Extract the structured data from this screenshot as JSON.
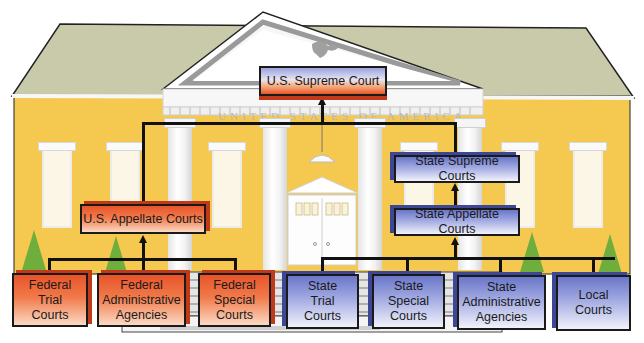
{
  "diagram": {
    "type": "hierarchy",
    "theme": "United States court system illustrated as a courthouse",
    "building": {
      "frieze_text": "UNITED STATES OF AMERICA",
      "colors": {
        "wall": "#f5c94f",
        "roof": "#c9caa9",
        "trim": "#f7f7f7",
        "tree": "#6fae3d"
      }
    },
    "colors": {
      "federal": "#e8542a",
      "state": "#6a76c9",
      "connector": "#111111"
    },
    "nodes": {
      "us_supreme_court": {
        "label": "U.S. Supreme Court",
        "system": "federal/state apex"
      },
      "us_appellate_courts": {
        "label": "U.S. Appellate Courts",
        "system": "federal"
      },
      "federal_trial_courts": {
        "label": "Federal\nTrial\nCourts",
        "system": "federal"
      },
      "federal_admin_agencies": {
        "label": "Federal\nAdministrative\nAgencies",
        "system": "federal"
      },
      "federal_special_courts": {
        "label": "Federal\nSpecial\nCourts",
        "system": "federal"
      },
      "state_supreme_courts": {
        "label": "State Supreme Courts",
        "system": "state"
      },
      "state_appellate_courts": {
        "label": "State Appellate Courts",
        "system": "state"
      },
      "state_trial_courts": {
        "label": "State\nTrial\nCourts",
        "system": "state"
      },
      "state_special_courts": {
        "label": "State\nSpecial\nCourts",
        "system": "state"
      },
      "state_admin_agencies": {
        "label": "State\nAdministrative\nAgencies",
        "system": "state"
      },
      "local_courts": {
        "label": "Local\nCourts",
        "system": "state"
      }
    },
    "edges": [
      {
        "from": "federal_trial_courts",
        "to": "us_appellate_courts"
      },
      {
        "from": "federal_admin_agencies",
        "to": "us_appellate_courts"
      },
      {
        "from": "federal_special_courts",
        "to": "us_appellate_courts"
      },
      {
        "from": "us_appellate_courts",
        "to": "us_supreme_court"
      },
      {
        "from": "state_trial_courts",
        "to": "state_appellate_courts"
      },
      {
        "from": "state_special_courts",
        "to": "state_appellate_courts"
      },
      {
        "from": "state_admin_agencies",
        "to": "state_appellate_courts"
      },
      {
        "from": "local_courts",
        "to": "state_appellate_courts"
      },
      {
        "from": "state_appellate_courts",
        "to": "state_supreme_courts"
      },
      {
        "from": "state_supreme_courts",
        "to": "us_supreme_court"
      }
    ]
  }
}
